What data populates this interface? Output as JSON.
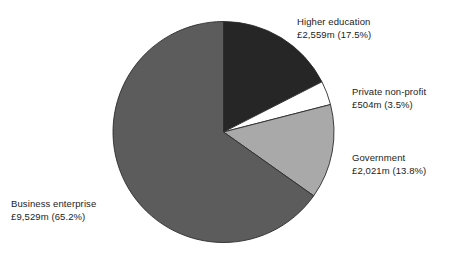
{
  "chart_data": {
    "type": "pie",
    "title": "",
    "subtitle": "",
    "xlabel": "",
    "ylabel": "",
    "legend_position": "none",
    "grid": false,
    "units": "£ million",
    "start_angle_deg": 0,
    "direction": "clockwise",
    "total_percent": 100.0,
    "categories": [
      "Higher education",
      "Private non-profit",
      "Government",
      "Business enterprise"
    ],
    "values": [
      2559,
      504,
      2021,
      9529
    ],
    "percentages": [
      17.5,
      3.5,
      13.8,
      65.2
    ],
    "value_labels": [
      "£2,559m",
      "£504m",
      "£2,021m",
      "£9,529m"
    ],
    "percent_labels": [
      "(17.5%)",
      "(3.5%)",
      "(13.8%)",
      "(65.2%)"
    ],
    "slices": [
      {
        "name": "Higher education",
        "value": 2559,
        "percent": 17.5,
        "value_label": "£2,559m",
        "percent_label": "(17.5%)",
        "color": "#262626"
      },
      {
        "name": "Private non-profit",
        "value": 504,
        "percent": 3.5,
        "value_label": "£504m",
        "percent_label": "(3.5%)",
        "color": "#ffffff"
      },
      {
        "name": "Government",
        "value": 2021,
        "percent": 13.8,
        "value_label": "£2,021m",
        "percent_label": "(13.8%)",
        "color": "#a9a9a9"
      },
      {
        "name": "Business enterprise",
        "value": 9529,
        "percent": 65.2,
        "value_label": "£9,529m",
        "percent_label": "(65.2%)",
        "color": "#5c5c5c"
      }
    ]
  },
  "labels": {
    "higher_education": {
      "line1": "Higher education",
      "line2": "£2,559m (17.5%)"
    },
    "private_non_profit": {
      "line1": "Private non-profit",
      "line2": "£504m (3.5%)"
    },
    "government": {
      "line1": "Government",
      "line2": "£2,021m (13.8%)"
    },
    "business_enterprise": {
      "line1": "Business enterprise",
      "line2": "£9,529m (65.2%)"
    }
  },
  "colors": {
    "background": "#ffffff",
    "text": "#1c1c1c",
    "outline": "#2b2b2b",
    "higher_education": "#262626",
    "private_non_profit": "#ffffff",
    "government": "#a9a9a9",
    "business_enterprise": "#5c5c5c"
  }
}
